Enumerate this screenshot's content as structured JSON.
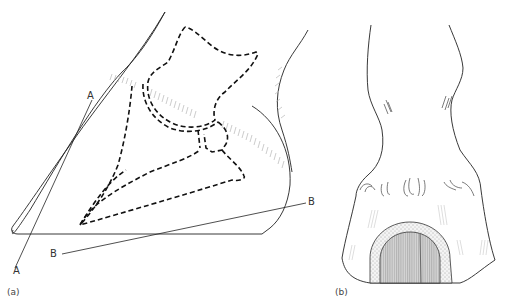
{
  "figure": {
    "panels": [
      {
        "id": "a",
        "label": "(a)",
        "description": "Lateral view of equine hoof showing bones (dashed) and reference lines",
        "lines": [
          {
            "name": "A-A",
            "start_label": "A",
            "end_label": "A"
          },
          {
            "name": "B-B",
            "start_label": "B",
            "end_label": "B"
          }
        ]
      },
      {
        "id": "b",
        "label": "(b)",
        "description": "Front view of equine hoof with cut section showing shaded sole region"
      }
    ],
    "labels": {
      "a_top": "A",
      "a_bottom": "A",
      "b_right": "B",
      "b_left": "B",
      "panel_a": "(a)",
      "panel_b": "(b)"
    },
    "colors": {
      "line": "#222222",
      "hatch": "#bdbdbd",
      "shade": "#9a9a9a",
      "stipple": "#555555"
    }
  }
}
